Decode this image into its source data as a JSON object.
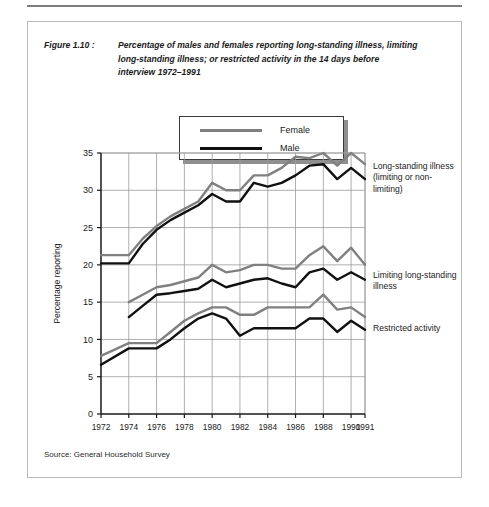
{
  "figure": {
    "label": "Figure 1.10 :",
    "caption": "Percentage of males and females reporting long-standing illness, limiting long-standing illness; or restricted activity in the 14 days before interview 1972–1991",
    "source": "Source: General Household Survey"
  },
  "legend": {
    "entries": [
      {
        "label": "Female",
        "color": "#808080"
      },
      {
        "label": "Male",
        "color": "#111111"
      }
    ]
  },
  "annotations": {
    "long_standing": "Long-standing illness (limiting or non-limiting)",
    "limiting": "Limiting long-standing illness",
    "restricted": "Restricted activity"
  },
  "chart_data": {
    "type": "line",
    "title": "Percentage of males and females reporting long-standing illness, limiting long-standing illness; or restricted activity in the 14 days before interview 1972–1991",
    "xlabel": "",
    "ylabel": "Percentage reporting",
    "xlim": [
      1972,
      1991
    ],
    "ylim": [
      0,
      35
    ],
    "yticks": [
      0,
      5,
      10,
      15,
      20,
      25,
      30,
      35
    ],
    "xticks": [
      1972,
      1974,
      1976,
      1978,
      1980,
      1982,
      1984,
      1986,
      1988,
      1990,
      1991
    ],
    "grid": true,
    "legend_position": "top-center",
    "x": [
      1972,
      1974,
      1975,
      1976,
      1977,
      1978,
      1979,
      1980,
      1981,
      1982,
      1983,
      1984,
      1985,
      1986,
      1987,
      1988,
      1989,
      1990,
      1991
    ],
    "series": [
      {
        "name": "Female – Long-standing illness (limiting or non-limiting)",
        "group": "long_standing",
        "sex": "Female",
        "color": "#808080",
        "values": [
          21.3,
          21.3,
          23.5,
          25.2,
          26.5,
          27.5,
          28.5,
          31.0,
          30.0,
          30.0,
          32.0,
          32.0,
          33.0,
          34.5,
          34.3,
          35.0,
          33.3,
          35.0,
          33.5
        ]
      },
      {
        "name": "Male – Long-standing illness (limiting or non-limiting)",
        "group": "long_standing",
        "sex": "Male",
        "color": "#111111",
        "values": [
          20.2,
          20.2,
          22.8,
          24.7,
          26.0,
          27.0,
          28.0,
          29.5,
          28.5,
          28.5,
          31.0,
          30.5,
          31.0,
          32.0,
          33.3,
          33.5,
          31.5,
          33.0,
          31.5
        ]
      },
      {
        "name": "Female – Limiting long-standing illness",
        "group": "limiting",
        "sex": "Female",
        "color": "#808080",
        "values": [
          null,
          15.0,
          16.0,
          17.0,
          17.3,
          17.8,
          18.3,
          20.0,
          19.0,
          19.3,
          20.0,
          20.0,
          19.5,
          19.5,
          21.3,
          22.5,
          20.5,
          22.3,
          20.0
        ]
      },
      {
        "name": "Male – Limiting long-standing illness",
        "group": "limiting",
        "sex": "Male",
        "color": "#111111",
        "values": [
          null,
          13.0,
          14.5,
          16.0,
          16.2,
          16.5,
          16.8,
          18.0,
          17.0,
          17.5,
          18.0,
          18.2,
          17.5,
          17.0,
          19.0,
          19.5,
          18.0,
          19.0,
          18.0
        ]
      },
      {
        "name": "Female – Restricted activity",
        "group": "restricted",
        "sex": "Female",
        "color": "#808080",
        "values": [
          7.8,
          9.5,
          9.5,
          9.5,
          11.0,
          12.5,
          13.5,
          14.3,
          14.3,
          13.3,
          13.3,
          14.3,
          14.3,
          14.3,
          14.3,
          16.0,
          14.0,
          14.3,
          13.0
        ]
      },
      {
        "name": "Male – Restricted activity",
        "group": "restricted",
        "sex": "Male",
        "color": "#111111",
        "values": [
          6.6,
          8.8,
          8.8,
          8.8,
          10.0,
          11.5,
          12.8,
          13.5,
          12.8,
          10.5,
          11.5,
          11.5,
          11.5,
          11.5,
          12.8,
          12.8,
          11.0,
          12.5,
          11.3
        ]
      }
    ]
  }
}
